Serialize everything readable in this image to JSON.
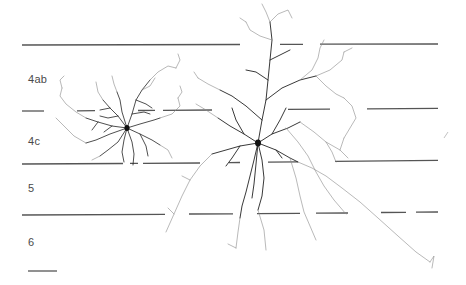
{
  "figure": {
    "type": "neuron-reconstruction",
    "layer_labels": [
      {
        "label": "4ab",
        "x": 28,
        "y": 83
      },
      {
        "label": "4c",
        "x": 28,
        "y": 145
      },
      {
        "label": "5",
        "x": 28,
        "y": 192
      },
      {
        "label": "6",
        "x": 28,
        "y": 246
      }
    ],
    "layer_boundaries": [
      {
        "name": "top-of-4ab",
        "y_left": 45,
        "y_right": 44
      },
      {
        "name": "4ab-4c",
        "y_left": 111,
        "y_right": 108
      },
      {
        "name": "4c-5",
        "y_left": 164,
        "y_right": 160
      },
      {
        "name": "5-6",
        "y_left": 215,
        "y_right": 211
      }
    ],
    "scale_bar": {
      "x1": 28,
      "x2": 57,
      "y": 271
    },
    "colors": {
      "boundary_line": "#555555",
      "dendrite_dark": "#1a1a1a",
      "dendrite_light": "#8a8a8a",
      "label": "#4a4a4a"
    },
    "neurons": [
      {
        "name": "small-stellate-neuron",
        "layer": "4c",
        "soma": {
          "x": 127,
          "y": 128
        }
      },
      {
        "name": "large-pyramidal-neuron",
        "layer": "4c",
        "soma": {
          "x": 258,
          "y": 143
        }
      }
    ]
  }
}
